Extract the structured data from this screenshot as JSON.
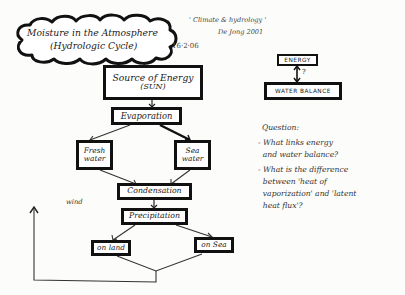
{
  "title": {
    "line1": "Moisture in the Atmosphere",
    "line2": "(Hydrologic Cycle)"
  },
  "reference": {
    "line1": "' Climate & hydrology '",
    "line2": "De Jong   2001"
  },
  "date": "16·2·06",
  "flow": {
    "source": {
      "line1": "Source of Energy",
      "line2": "(SUN)"
    },
    "evaporation": "Evaporation",
    "fresh_water": {
      "line1": "Fresh",
      "line2": "water"
    },
    "sea_water": {
      "line1": "Sea",
      "line2": "water"
    },
    "condensation": "Condensation",
    "precipitation": "Precipitation",
    "on_land": "on land",
    "on_sea": "on Sea",
    "wind_label": "wind"
  },
  "relation": {
    "energy": "ENERGY",
    "water_balance": "WATER BALANCE",
    "link_mark": "?"
  },
  "questions": {
    "heading": "Question:",
    "lines": [
      "- What links energy",
      "  and water balance?",
      "- What is the difference",
      "  between 'heat of",
      "  vaporization' and 'latent",
      "  heat flux'?"
    ]
  },
  "colors": {
    "ink": "#111111",
    "paper": "#fcfcfa"
  }
}
